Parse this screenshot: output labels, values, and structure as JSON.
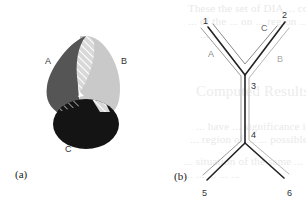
{
  "figure": {
    "panel_a": {
      "caption": "(a)",
      "labels": {
        "A": "A",
        "B": "B",
        "C": "C"
      },
      "colors": {
        "A": "#555555",
        "B": "#c9c9c9",
        "C": "#141414",
        "hatch": "#ffffff"
      }
    },
    "panel_b": {
      "caption": "(b)",
      "node_labels": {
        "n1": "1",
        "n2": "2",
        "n3": "3",
        "n4": "4",
        "n5": "5",
        "n6": "6"
      },
      "path_labels": {
        "A": "A",
        "B": "B",
        "C": "C"
      },
      "colors": {
        "main": "#222222",
        "path_a": "#9a9a9a",
        "path_b": "#b5b5b5",
        "path_c": "#7a7a7a"
      }
    }
  },
  "background_bleed": {
    "lines": [
      "These the set of DIA ... conditions for two ...",
      "... of the ... on ... region ...",
      "... ..."
    ],
    "heading": "Computed Results",
    "para": [
      "... have ... significance in ... areas ... ",
      "... region of ... ... possible ...",
      "... situation of the same ... during ...",
      "... ... ... ... ..."
    ]
  }
}
